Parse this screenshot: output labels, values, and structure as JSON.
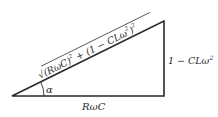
{
  "diagram": {
    "type": "right-triangle",
    "line_color": "#2a2a2a",
    "vertices": {
      "bottom_left": [
        12,
        96
      ],
      "bottom_right": [
        164,
        96
      ],
      "top_right": [
        164,
        21
      ]
    },
    "labels": {
      "hypotenuse": {
        "radical": "√",
        "term1": "(RωC)",
        "exp1": "2",
        "plus": " + ",
        "term2": "(1 − CLω",
        "exp2": "2",
        "term2_close": ")",
        "exp3": "2"
      },
      "vertical_side": {
        "text": "1 − CLω",
        "exponent": "2"
      },
      "base": "RωC",
      "angle": "α"
    }
  }
}
